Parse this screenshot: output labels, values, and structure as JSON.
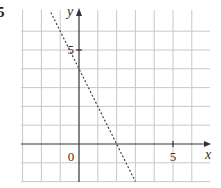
{
  "question_number": "5",
  "chart_data": {
    "type": "line",
    "title": "",
    "xlabel": "x",
    "ylabel": "y",
    "xlim": [
      -3,
      6.5
    ],
    "ylim": [
      -2,
      7
    ],
    "grid": true,
    "x_ticks_labeled": [
      {
        "value": 0,
        "label": "0"
      },
      {
        "value": 5,
        "label": "5"
      }
    ],
    "y_ticks_labeled": [
      {
        "value": 5,
        "label": "5"
      }
    ],
    "series": [
      {
        "name": "y = -2x + 4",
        "style": "dashed",
        "x": [
          -1.5,
          3
        ],
        "y": [
          7,
          -2
        ]
      }
    ]
  }
}
